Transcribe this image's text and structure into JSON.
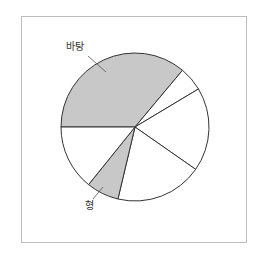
{
  "chart_data": {
    "type": "pie",
    "title": "",
    "center": [
      135,
      127
    ],
    "radius": 74,
    "start_angle_deg": 180,
    "direction": "clockwise",
    "slices": [
      {
        "label": "바탕",
        "value": 36.1,
        "fill": "#c8c8c8",
        "labeled": true
      },
      {
        "label": "",
        "value": 5.3,
        "fill": "#ffffff",
        "labeled": false
      },
      {
        "label": "",
        "value": 18.3,
        "fill": "#ffffff",
        "labeled": false
      },
      {
        "label": "",
        "value": 19.0,
        "fill": "#ffffff",
        "labeled": false
      },
      {
        "label": "형",
        "value": 7.1,
        "fill": "#c8c8c8",
        "labeled": true
      },
      {
        "label": "",
        "value": 14.2,
        "fill": "#ffffff",
        "labeled": false
      }
    ],
    "annotations": [
      {
        "text": "바탕",
        "x": 66,
        "y": 42,
        "leader": [
          [
            88,
            56
          ],
          [
            106,
            72
          ]
        ]
      },
      {
        "text": "형",
        "x": 85,
        "y": 201,
        "leader": [
          [
            93,
            199
          ],
          [
            103,
            187
          ]
        ]
      }
    ],
    "legend": "none",
    "stroke": "#333333"
  },
  "labels": {
    "background": "바탕",
    "figure": "형"
  }
}
